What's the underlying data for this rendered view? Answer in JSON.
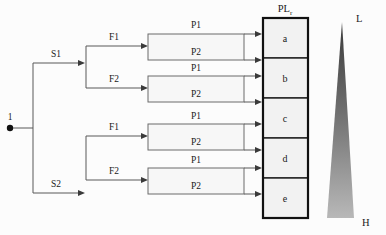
{
  "diagram": {
    "type": "tree-flow-diagram",
    "root": {
      "label": "1",
      "name": "root-node"
    },
    "stage1": {
      "name": "service-branches",
      "branches": [
        {
          "label": "S1",
          "name": "branch-s1"
        },
        {
          "label": "S2",
          "name": "branch-s2"
        }
      ]
    },
    "stage2": {
      "name": "feature-branches",
      "branches": [
        {
          "label": "F1",
          "name": "branch-s1-f1"
        },
        {
          "label": "F2",
          "name": "branch-s1-f2"
        },
        {
          "label": "F1",
          "name": "branch-s2-f1"
        },
        {
          "label": "F2",
          "name": "branch-s2-f2"
        }
      ]
    },
    "stage3": {
      "name": "path-edges",
      "edges": [
        {
          "label": "P1",
          "name": "edge-p1-box1-top"
        },
        {
          "label": "P2",
          "name": "edge-p2-box1-bottom"
        },
        {
          "label": "P1",
          "name": "edge-p1-box2-top"
        },
        {
          "label": "P2",
          "name": "edge-p2-box2-bottom"
        },
        {
          "label": "P1",
          "name": "edge-p1-box3-top"
        },
        {
          "label": "P2",
          "name": "edge-p2-box3-bottom"
        },
        {
          "label": "P1",
          "name": "edge-p1-box4-top"
        },
        {
          "label": "P2",
          "name": "edge-p2-box4-bottom"
        }
      ]
    },
    "pl_column": {
      "header": "PL",
      "header_subscript": "r",
      "name": "pl-column",
      "cells": [
        {
          "label": "a",
          "name": "pl-cell-a"
        },
        {
          "label": "b",
          "name": "pl-cell-b"
        },
        {
          "label": "c",
          "name": "pl-cell-c"
        },
        {
          "label": "d",
          "name": "pl-cell-d"
        },
        {
          "label": "e",
          "name": "pl-cell-e"
        }
      ]
    },
    "gradient_scale": {
      "name": "priority-gradient",
      "top_label": "L",
      "bottom_label": "H",
      "top_color": "#3a3a3a",
      "bottom_color": "#b5b5b5"
    }
  }
}
